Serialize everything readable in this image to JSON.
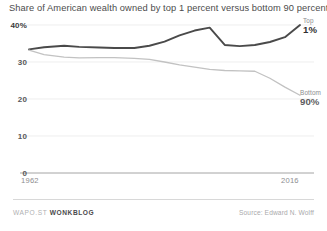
{
  "chart_data": {
    "type": "line",
    "title": "Share of American wealth owned by top 1 percent versus bottom 90 percent",
    "xlabel": "",
    "ylabel": "",
    "xlim": [
      1962,
      2016
    ],
    "ylim": [
      0,
      40
    ],
    "grid": true,
    "legend_position": "direct-labels-right",
    "yticks": [
      {
        "value": 40,
        "label": "40%"
      },
      {
        "value": 30,
        "label": "30"
      },
      {
        "value": 20,
        "label": "20"
      },
      {
        "value": 10,
        "label": "10"
      },
      {
        "value": 0,
        "label": "0"
      }
    ],
    "xticks": [
      {
        "value": 1962,
        "label": "1962"
      },
      {
        "value": 2016,
        "label": "2016"
      }
    ],
    "series": [
      {
        "name": "Top 1%",
        "label_name": "Top",
        "label_value": "1%",
        "color": "#4a4a4a",
        "x": [
          1962,
          1965,
          1969,
          1972,
          1976,
          1979,
          1983,
          1986,
          1989,
          1992,
          1995,
          1998,
          2001,
          2004,
          2007,
          2010,
          2013,
          2016
        ],
        "values": [
          33.4,
          34.0,
          34.4,
          34.1,
          33.9,
          33.8,
          33.8,
          34.4,
          35.5,
          37.2,
          38.5,
          39.3,
          34.6,
          34.3,
          34.6,
          35.4,
          36.7,
          40.0
        ]
      },
      {
        "name": "Bottom 90%",
        "label_name": "Bottom",
        "label_value": "90%",
        "color": "#c2c2c2",
        "x": [
          1962,
          1965,
          1969,
          1972,
          1976,
          1979,
          1983,
          1986,
          1989,
          1992,
          1995,
          1998,
          2001,
          2004,
          2007,
          2010,
          2013,
          2016
        ],
        "values": [
          33.2,
          32.0,
          31.3,
          31.1,
          31.2,
          31.2,
          31.0,
          30.7,
          30.0,
          29.2,
          28.6,
          28.0,
          27.7,
          27.6,
          27.5,
          25.6,
          23.2,
          21.0
        ]
      }
    ]
  },
  "footer": {
    "credit_prefix": "WAPO.ST",
    "credit_brand": "WONKBLOG",
    "source": "Source: Edward N. Wolff"
  }
}
